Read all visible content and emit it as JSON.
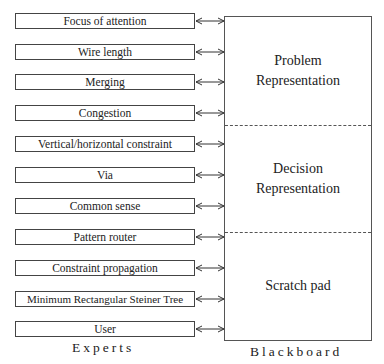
{
  "experts": {
    "caption": "Experts",
    "items": [
      {
        "label": "Focus of attention"
      },
      {
        "label": "Wire length"
      },
      {
        "label": "Merging"
      },
      {
        "label": "Congestion"
      },
      {
        "label": "Vertical/horizontal constraint"
      },
      {
        "label": "Via"
      },
      {
        "label": "Common sense"
      },
      {
        "label": "Pattern router"
      },
      {
        "label": "Constraint propagation"
      },
      {
        "label": "Minimum Rectangular Steiner Tree"
      },
      {
        "label": "User"
      }
    ]
  },
  "blackboard": {
    "caption": "Blackboard",
    "sections": [
      {
        "line1": "Problem",
        "line2": "Representation"
      },
      {
        "line1": "Decision",
        "line2": "Representation"
      },
      {
        "line1": "Scratch pad",
        "line2": ""
      }
    ]
  }
}
